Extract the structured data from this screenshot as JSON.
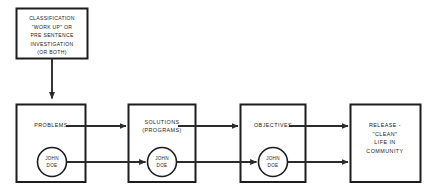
{
  "diagram": {
    "background_color": "#ffffff",
    "line_color": "#2b2b2b",
    "text_color": "#1a1a1a",
    "head_box": {
      "name": "classification-box",
      "lines": [
        "CLASSIFICATION",
        "\"WORK UP\" OR",
        "PRE SENTENCE",
        "INVESTIGATION",
        "(OR BOTH)"
      ]
    },
    "stages": [
      {
        "name": "problems",
        "lines": [
          "PROBLEMS"
        ],
        "circle": {
          "lines": [
            "JOHN",
            "DOE"
          ]
        }
      },
      {
        "name": "solutions",
        "lines": [
          "SOLUTIONS",
          "(PROGRAMS)"
        ],
        "circle": {
          "lines": [
            "JOHN",
            "DOE"
          ]
        }
      },
      {
        "name": "objectives",
        "lines": [
          "OBJECTIVES"
        ],
        "circle": {
          "lines": [
            "JOHN",
            "DOE"
          ]
        }
      },
      {
        "name": "release",
        "lines": [
          "RELEASE -",
          "\"CLEAN\"",
          "LIFE IN",
          "COMMUNITY"
        ],
        "circle": null
      }
    ],
    "connectors": [
      {
        "name": "classification-to-problems",
        "type": "vertical-arrow"
      },
      {
        "name": "problems-to-solutions-upper",
        "type": "horizontal-arrow"
      },
      {
        "name": "problems-to-solutions-lower",
        "type": "horizontal-arrow"
      },
      {
        "name": "solutions-to-objectives-upper",
        "type": "horizontal-arrow"
      },
      {
        "name": "solutions-to-objectives-lower",
        "type": "horizontal-arrow"
      },
      {
        "name": "objectives-to-release-upper",
        "type": "horizontal-arrow"
      },
      {
        "name": "objectives-to-release-lower",
        "type": "horizontal-arrow"
      }
    ]
  }
}
